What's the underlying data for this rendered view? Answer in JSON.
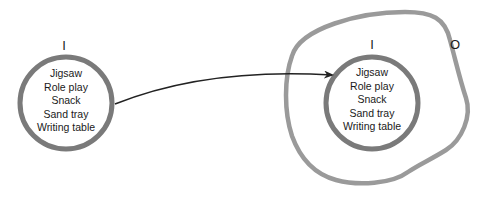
{
  "diagram": {
    "type": "set-transfer",
    "colors": {
      "circle_stroke": "#7a7a7a",
      "outer_boundary_stroke": "#9a9a9a",
      "arrow": "#222222",
      "text": "#1a1a1a",
      "background": "#ffffff"
    },
    "left_set": {
      "label": "I",
      "items": [
        "Jigsaw",
        "Role play",
        "Snack",
        "Sand tray",
        "Writing table"
      ]
    },
    "right_set": {
      "label": "I",
      "items": [
        "Jigsaw",
        "Role play",
        "Snack",
        "Sand tray",
        "Writing table"
      ]
    },
    "outer_region": {
      "label": "O"
    },
    "arrow": {
      "from": "left_set",
      "to": "right_set"
    }
  }
}
